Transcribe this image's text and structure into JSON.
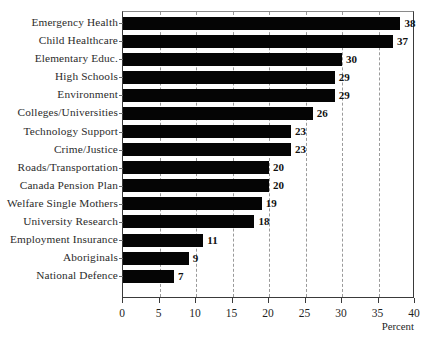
{
  "chart_data": {
    "type": "bar",
    "orientation": "horizontal",
    "title": "",
    "subtitle": "",
    "xlabel": "Percent",
    "ylabel": "",
    "xlim": [
      0,
      40
    ],
    "xticks": [
      0,
      5,
      10,
      15,
      20,
      25,
      30,
      35,
      40
    ],
    "xtick_labels": [
      "0",
      "5",
      "10",
      "15",
      "20",
      "25",
      "30",
      "35",
      "40"
    ],
    "grid": "vertical-dashed",
    "legend": "none",
    "bar_color": "#050505",
    "categories": [
      "Emergency Health",
      "Child Healthcare",
      "Elementary Educ.",
      "High Schools",
      "Environment",
      "Colleges/Universities",
      "Technology Support",
      "Crime/Justice",
      "Roads/Transportation",
      "Canada Pension Plan",
      "Welfare Single Mothers",
      "University Research",
      "Employment Insurance",
      "Aboriginals",
      "National Defence"
    ],
    "values": [
      38,
      37,
      30,
      29,
      29,
      26,
      23,
      23,
      20,
      20,
      19,
      18,
      11,
      9,
      7
    ],
    "value_labels": [
      "38",
      "37",
      "30",
      "29",
      "29",
      "26",
      "23",
      "23",
      "20",
      "20",
      "19",
      "18",
      "11",
      "9",
      "7"
    ]
  }
}
